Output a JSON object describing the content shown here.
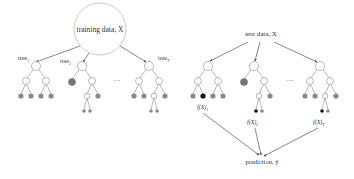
{
  "left_panel": {
    "root_label": "training data, X",
    "tree_labels": [
      "tree",
      "tree",
      "tree"
    ],
    "tree_subscripts": [
      "1",
      "2",
      "T"
    ],
    "ellipsis": "···"
  },
  "right_panel": {
    "root_label": "test data, X",
    "outputs": [
      "f(X)",
      "f(X)",
      "f(X)"
    ],
    "output_subscripts": [
      "1",
      "2",
      "T"
    ],
    "ellipsis": "···",
    "prediction_label": "prediction, ŷ"
  },
  "colors": {
    "line": "#555555",
    "node_fill": "#ffffff",
    "leaf_gray": "#8a8a8a",
    "leaf_black": "#111111",
    "text": "#333333"
  }
}
